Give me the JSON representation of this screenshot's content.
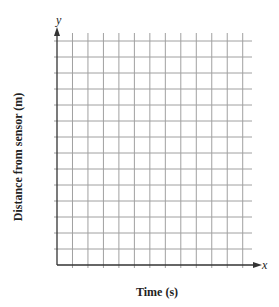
{
  "chart_data": {
    "type": "line",
    "title": "",
    "xlabel": "Time (s)",
    "ylabel": "Distance from sensor (m)",
    "x_axis_symbol": "x",
    "y_axis_symbol": "y",
    "grid": true,
    "grid_columns": 13,
    "grid_rows": 14,
    "series": [],
    "tick_labels_x": [],
    "tick_labels_y": [],
    "legend": null
  },
  "colors": {
    "grid": "#a0a0a0",
    "axis": "#333333",
    "text": "#222222"
  }
}
